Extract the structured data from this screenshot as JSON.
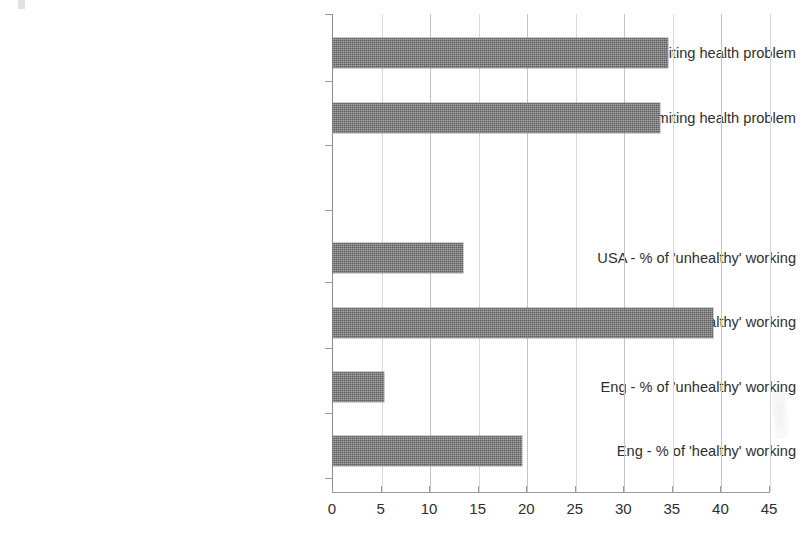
{
  "chart_data": {
    "type": "bar",
    "orientation": "horizontal",
    "title": "",
    "subtitle": "",
    "xlabel": "",
    "ylabel": "",
    "xlim": [
      0,
      45
    ],
    "xticks": [
      0,
      5,
      10,
      15,
      20,
      25,
      30,
      35,
      40,
      45
    ],
    "xtick_labels": [
      "0",
      "5",
      "10",
      "15",
      "20",
      "25",
      "30",
      "35",
      "40",
      "45"
    ],
    "grid": true,
    "grid_axis": "x",
    "legend": false,
    "legend_position": "none",
    "bar_color": "#737373",
    "axis_color": "#9a9a9a",
    "grid_color": "#c4c4c4",
    "categories": [
      "USA - % with work-limiting health problem",
      "Eng - % with work-limiting health problem",
      "",
      "",
      "USA - % of 'unhealthy' working",
      "USA - % of 'healthy' working",
      "Eng - % of 'unhealthy' working",
      "Eng - % of 'healthy' working"
    ],
    "values": [
      34.5,
      33.7,
      null,
      null,
      13.4,
      39.1,
      5.3,
      19.5
    ],
    "bars": [
      {
        "label": "USA - % with work-limiting health problem",
        "value": 34.5
      },
      {
        "label": "Eng - % with work-limiting health problem",
        "value": 33.7
      },
      {
        "label": "USA - % of 'unhealthy' working",
        "value": 13.4
      },
      {
        "label": "USA - % of 'healthy' working",
        "value": 39.1
      },
      {
        "label": "Eng - % of 'unhealthy' working",
        "value": 5.3
      },
      {
        "label": "Eng - % of 'healthy' working",
        "value": 19.5
      }
    ]
  }
}
